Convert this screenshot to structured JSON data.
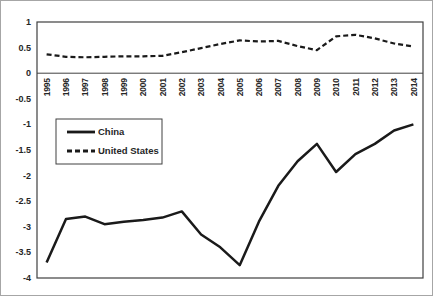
{
  "chart_data": {
    "type": "line",
    "title": "",
    "xlabel": "",
    "ylabel": "",
    "grid": false,
    "x_labels": [
      "1995",
      "1996",
      "1997",
      "1998",
      "1999",
      "2000",
      "2001",
      "2002",
      "2003",
      "2004",
      "2005",
      "2006",
      "2007",
      "2008",
      "2009",
      "2010",
      "2011",
      "2012",
      "2013",
      "2014"
    ],
    "series": [
      {
        "name": "China",
        "style": "solid",
        "color": "#1a1a1a",
        "values": [
          -3.7,
          -2.85,
          -2.8,
          -2.95,
          -2.9,
          -2.87,
          -2.82,
          -2.7,
          -3.15,
          -3.4,
          -3.75,
          -2.9,
          -2.2,
          -1.72,
          -1.38,
          -1.93,
          -1.58,
          -1.38,
          -1.12,
          -1.0
        ]
      },
      {
        "name": "United States",
        "style": "dashed",
        "color": "#1a1a1a",
        "values": [
          0.37,
          0.32,
          0.31,
          0.32,
          0.33,
          0.33,
          0.34,
          0.41,
          0.49,
          0.57,
          0.64,
          0.62,
          0.63,
          0.53,
          0.45,
          0.72,
          0.75,
          0.68,
          0.58,
          0.52
        ]
      }
    ],
    "ylim": [
      -4,
      1
    ],
    "yticks": [
      "1",
      "0.5",
      "0",
      "-0.5",
      "-1",
      "-1.5",
      "-2",
      "-2.5",
      "-3",
      "-3.5",
      "-4"
    ],
    "x_axis_position": 0,
    "legend": {
      "position": "inside-upper-left",
      "entries": [
        "China",
        "United States"
      ]
    },
    "colors": {
      "axis": "#404040",
      "series": "#1a1a1a",
      "text": "#262626",
      "frame_border": "#a6a6a6",
      "background": "#ffffff"
    }
  }
}
